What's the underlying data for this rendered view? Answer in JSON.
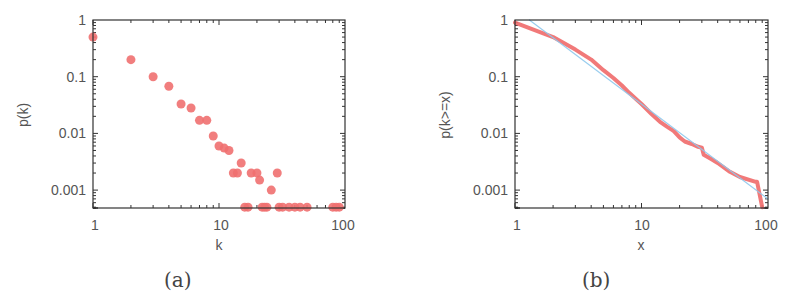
{
  "chart_data": [
    {
      "id": "a",
      "type": "scatter",
      "caption": "(a)",
      "title": "",
      "xlabel": "k",
      "ylabel": "p(k)",
      "xscale": "log",
      "yscale": "log",
      "xlim": [
        1,
        100
      ],
      "ylim": [
        0.0005,
        1
      ],
      "xticks": [
        "1",
        "10",
        "100"
      ],
      "yticks": [
        "1",
        "0.1",
        "0.01",
        "0.001"
      ],
      "grid": false,
      "legend": null,
      "marker_color": "#f07070",
      "series": [
        {
          "name": "degree distribution",
          "points": [
            [
              1,
              0.5
            ],
            [
              2,
              0.2
            ],
            [
              3,
              0.1
            ],
            [
              4,
              0.068
            ],
            [
              5,
              0.033
            ],
            [
              6,
              0.028
            ],
            [
              7,
              0.017
            ],
            [
              8,
              0.017
            ],
            [
              9,
              0.009
            ],
            [
              10,
              0.006
            ],
            [
              11,
              0.0055
            ],
            [
              12,
              0.005
            ],
            [
              13,
              0.002
            ],
            [
              14,
              0.002
            ],
            [
              15,
              0.003
            ],
            [
              18,
              0.002
            ],
            [
              20,
              0.002
            ],
            [
              21,
              0.0015
            ],
            [
              26,
              0.001
            ],
            [
              29,
              0.002
            ],
            [
              16,
              0.0005
            ],
            [
              17,
              0.0005
            ],
            [
              22,
              0.0005
            ],
            [
              23,
              0.0005
            ],
            [
              24,
              0.0005
            ],
            [
              30,
              0.0005
            ],
            [
              32,
              0.0005
            ],
            [
              36,
              0.0005
            ],
            [
              40,
              0.0005
            ],
            [
              44,
              0.0005
            ],
            [
              50,
              0.0005
            ],
            [
              80,
              0.0005
            ],
            [
              85,
              0.0005
            ],
            [
              90,
              0.0005
            ]
          ]
        }
      ]
    },
    {
      "id": "b",
      "type": "line",
      "caption": "(b)",
      "title": "",
      "xlabel": "x",
      "ylabel": "p(k>=x)",
      "xscale": "log",
      "yscale": "log",
      "xlim": [
        1,
        100
      ],
      "ylim": [
        0.0005,
        1
      ],
      "xticks": [
        "1",
        "10",
        "100"
      ],
      "yticks": [
        "1",
        "0.1",
        "0.01",
        "0.001"
      ],
      "grid": false,
      "legend": null,
      "series": [
        {
          "name": "empirical CCDF",
          "color": "#f06a6a",
          "width": 4,
          "points": [
            [
              1,
              0.9
            ],
            [
              2,
              0.5
            ],
            [
              3,
              0.3
            ],
            [
              4,
              0.2
            ],
            [
              5,
              0.13
            ],
            [
              6,
              0.095
            ],
            [
              7,
              0.07
            ],
            [
              8,
              0.052
            ],
            [
              9,
              0.041
            ],
            [
              10,
              0.033
            ],
            [
              12,
              0.022
            ],
            [
              14,
              0.016
            ],
            [
              16,
              0.013
            ],
            [
              18,
              0.011
            ],
            [
              20,
              0.0085
            ],
            [
              22,
              0.0072
            ],
            [
              25,
              0.0065
            ],
            [
              28,
              0.0058
            ],
            [
              30,
              0.0056
            ],
            [
              31,
              0.0042
            ],
            [
              35,
              0.0036
            ],
            [
              40,
              0.003
            ],
            [
              50,
              0.0021
            ],
            [
              60,
              0.0017
            ],
            [
              80,
              0.0014
            ],
            [
              82,
              0.0014
            ],
            [
              90,
              0.0005
            ]
          ]
        },
        {
          "name": "power-law fit",
          "color": "#8ec8ec",
          "width": 1.2,
          "points": [
            [
              1.3,
              1
            ],
            [
              100,
              0.0007
            ]
          ]
        }
      ]
    }
  ]
}
